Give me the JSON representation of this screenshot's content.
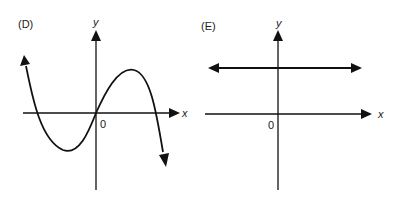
{
  "panels": [
    {
      "id": "D",
      "label": "(D)",
      "x_axis_label": "x",
      "y_axis_label": "y",
      "origin_label": "0",
      "graph": {
        "type": "cubic",
        "description": "Cubic curve rising from upper-left, crossing x-axis at a negative root, local minimum below x-axis, passing through origin, local maximum above x-axis, crossing x-axis at a positive root, falling to lower-right",
        "end_behavior": {
          "left": "up",
          "right": "down"
        },
        "roots": [
          "negative",
          "0",
          "positive"
        ]
      }
    },
    {
      "id": "E",
      "label": "(E)",
      "x_axis_label": "x",
      "y_axis_label": "y",
      "origin_label": "0",
      "graph": {
        "type": "constant",
        "description": "Horizontal line above the x-axis with arrows at both ends",
        "end_behavior": {
          "left": "horizontal",
          "right": "horizontal"
        }
      }
    }
  ]
}
